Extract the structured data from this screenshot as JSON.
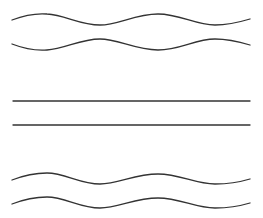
{
  "canvas": {
    "width": 263,
    "height": 218,
    "background": "#ffffff"
  },
  "style": {
    "stroke_color": "#333333",
    "stroke_width": 1.3
  },
  "lines": [
    {
      "id": "wave-1",
      "type": "wavy",
      "d": "M12,20 C25,15 35,13 47,14 C65,15 80,25 100,25 C118,25 135,14 158,14 C180,14 195,25 215,25 C230,25 240,22 250,19"
    },
    {
      "id": "wave-2",
      "type": "wavy",
      "d": "M12,44 C25,49 35,51 47,50 C65,49 80,39 100,39 C118,39 135,50 158,50 C180,50 195,39 215,39 C230,39 240,42 250,45"
    },
    {
      "id": "straight-1",
      "type": "straight",
      "d": "M13,101 L250,101"
    },
    {
      "id": "straight-2",
      "type": "straight",
      "d": "M13,125 L250,125"
    },
    {
      "id": "wave-3",
      "type": "wavy",
      "d": "M12,180 C25,175 35,173 47,173 C65,173 80,184 100,184 C118,184 135,174 158,174 C180,174 195,184 215,184 C230,184 240,182 250,179"
    },
    {
      "id": "wave-4",
      "type": "wavy",
      "d": "M12,204 C25,199 35,197 47,197 C65,197 80,208 100,208 C118,208 135,198 158,198 C180,198 195,208 215,208 C230,208 240,206 250,203"
    }
  ]
}
